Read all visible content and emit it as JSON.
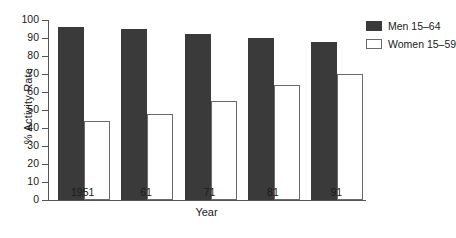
{
  "chart_data": {
    "type": "bar",
    "title": "",
    "xlabel": "Year",
    "ylabel": "% Activity Rate",
    "categories": [
      "1951",
      "61",
      "71",
      "81",
      "91"
    ],
    "series": [
      {
        "name": "Men 15–64",
        "color": "#3a3a3a",
        "values": [
          96,
          95,
          92,
          90,
          88
        ]
      },
      {
        "name": "Women 15–59",
        "color": "#ffffff",
        "values": [
          44,
          48,
          55,
          64,
          70
        ]
      }
    ],
    "ylim": [
      0,
      100
    ],
    "yticks": [
      0,
      10,
      20,
      30,
      40,
      50,
      60,
      70,
      80,
      90,
      100
    ],
    "ytick_labels": [
      "0",
      "10",
      "20",
      "30",
      "40",
      "50",
      "60",
      "70",
      "80",
      "90",
      "100"
    ],
    "grid": false,
    "legend_position": "top-right"
  },
  "legend": {
    "items": [
      {
        "label": "Men 15–64"
      },
      {
        "label": "Women 15–59"
      }
    ]
  },
  "axes": {
    "x_title": "Year",
    "y_title": "% Activity Rate"
  }
}
